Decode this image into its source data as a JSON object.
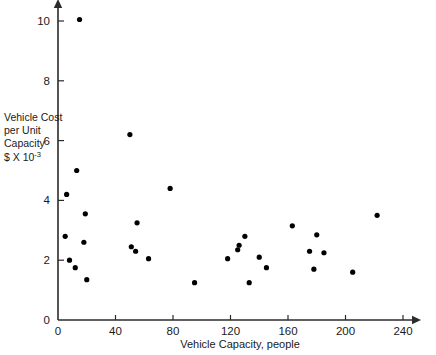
{
  "chart_data": {
    "type": "scatter",
    "title": "",
    "xlabel": "Vehicle Capacity, people",
    "ylabel_lines": [
      "Vehicle Cost",
      "per Unit",
      "Capacity",
      "$ X 10"
    ],
    "ylabel_exponent": "-3",
    "xlim": [
      0,
      240
    ],
    "ylim": [
      0,
      10.6
    ],
    "xticks": [
      0,
      40,
      80,
      120,
      160,
      200,
      240
    ],
    "xticklabels": [
      "0",
      "40",
      "80",
      "120",
      "160",
      "200",
      "240"
    ],
    "yticks": [
      0,
      2,
      4,
      6,
      8,
      10
    ],
    "yticklabels": [
      "0",
      "2",
      "4",
      "6",
      "8",
      "10"
    ],
    "grid": false,
    "legend": null,
    "marker": "filled-circle",
    "marker_color": "#000000",
    "points": [
      {
        "x": 15,
        "y": 10.05
      },
      {
        "x": 50,
        "y": 6.2
      },
      {
        "x": 13,
        "y": 5.0
      },
      {
        "x": 78,
        "y": 4.4
      },
      {
        "x": 6,
        "y": 4.2
      },
      {
        "x": 19,
        "y": 3.55
      },
      {
        "x": 222,
        "y": 3.5
      },
      {
        "x": 55,
        "y": 3.25
      },
      {
        "x": 163,
        "y": 3.15
      },
      {
        "x": 5,
        "y": 2.8
      },
      {
        "x": 18,
        "y": 2.6
      },
      {
        "x": 180,
        "y": 2.85
      },
      {
        "x": 130,
        "y": 2.8
      },
      {
        "x": 126,
        "y": 2.5
      },
      {
        "x": 125,
        "y": 2.35
      },
      {
        "x": 51,
        "y": 2.45
      },
      {
        "x": 54,
        "y": 2.3
      },
      {
        "x": 175,
        "y": 2.3
      },
      {
        "x": 185,
        "y": 2.25
      },
      {
        "x": 8,
        "y": 2.0
      },
      {
        "x": 118,
        "y": 2.05
      },
      {
        "x": 140,
        "y": 2.1
      },
      {
        "x": 63,
        "y": 2.05
      },
      {
        "x": 12,
        "y": 1.75
      },
      {
        "x": 145,
        "y": 1.75
      },
      {
        "x": 178,
        "y": 1.7
      },
      {
        "x": 205,
        "y": 1.6
      },
      {
        "x": 20,
        "y": 1.35
      },
      {
        "x": 95,
        "y": 1.25
      },
      {
        "x": 133,
        "y": 1.25
      }
    ]
  }
}
